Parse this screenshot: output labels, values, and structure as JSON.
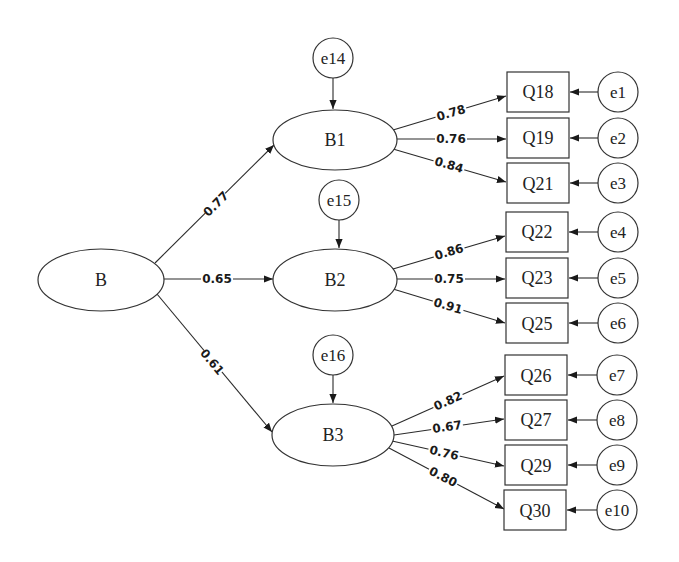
{
  "diagram": {
    "type": "structural-equation-model",
    "second_order_factor": {
      "id": "B",
      "label": "B"
    },
    "first_order_factors": [
      {
        "id": "B1",
        "label": "B1",
        "loading_from_B": "0.77",
        "disturbance": "e14",
        "indicators": [
          {
            "label": "Q18",
            "loading": "0.78",
            "error": "e1"
          },
          {
            "label": "Q19",
            "loading": "0.76",
            "error": "e2"
          },
          {
            "label": "Q21",
            "loading": "0.84",
            "error": "e3"
          }
        ]
      },
      {
        "id": "B2",
        "label": "B2",
        "loading_from_B": "0.65",
        "disturbance": "e15",
        "indicators": [
          {
            "label": "Q22",
            "loading": "0.86",
            "error": "e4"
          },
          {
            "label": "Q23",
            "loading": "0.75",
            "error": "e5"
          },
          {
            "label": "Q25",
            "loading": "0.91",
            "error": "e6"
          }
        ]
      },
      {
        "id": "B3",
        "label": "B3",
        "loading_from_B": "0.61",
        "disturbance": "e16",
        "indicators": [
          {
            "label": "Q26",
            "loading": "0.82",
            "error": "e7"
          },
          {
            "label": "Q27",
            "loading": "0.67",
            "error": "e8"
          },
          {
            "label": "Q29",
            "loading": "0.76",
            "error": "e9"
          },
          {
            "label": "Q30",
            "loading": "0.80",
            "error": "e10"
          }
        ]
      }
    ]
  },
  "labels": {
    "B": "B",
    "B1": "B1",
    "B2": "B2",
    "B3": "B3",
    "e14": "e14",
    "e15": "e15",
    "e16": "e16",
    "c_B_B1": "0.77",
    "c_B_B2": "0.65",
    "c_B_B3": "0.61",
    "Q18": "Q18",
    "Q19": "Q19",
    "Q21": "Q21",
    "Q22": "Q22",
    "Q23": "Q23",
    "Q25": "Q25",
    "Q26": "Q26",
    "Q27": "Q27",
    "Q29": "Q29",
    "Q30": "Q30",
    "c_Q18": "0.78",
    "c_Q19": "0.76",
    "c_Q21": "0.84",
    "c_Q22": "0.86",
    "c_Q23": "0.75",
    "c_Q25": "0.91",
    "c_Q26": "0.82",
    "c_Q27": "0.67",
    "c_Q29": "0.76",
    "c_Q30": "0.80",
    "e1": "e1",
    "e2": "e2",
    "e3": "e3",
    "e4": "e4",
    "e5": "e5",
    "e6": "e6",
    "e7": "e7",
    "e8": "e8",
    "e9": "e9",
    "e10": "e10"
  },
  "colors": {
    "stroke": "#333333",
    "background": "#ffffff",
    "text": "#222222"
  }
}
